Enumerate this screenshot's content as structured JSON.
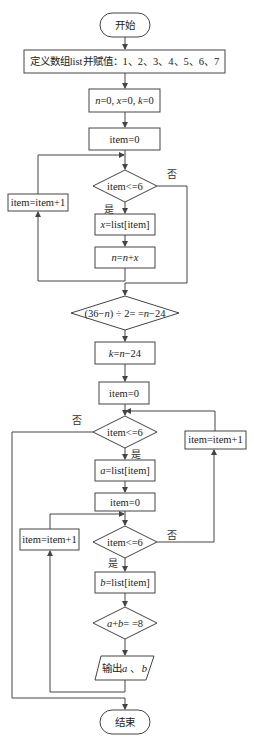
{
  "diagram": {
    "type": "flowchart",
    "colors": {
      "stroke": "#444444",
      "text": "#222222",
      "background": "#ffffff"
    },
    "nodes": {
      "start": {
        "shape": "terminal",
        "label": "开始"
      },
      "define_list": {
        "shape": "process",
        "label": "定义数组list并赋值：1、2、3、4、5、6、7"
      },
      "init_vars": {
        "shape": "process",
        "label": "n=0, x=0, k=0"
      },
      "item_init_1": {
        "shape": "process",
        "label": "item=0"
      },
      "cond_1": {
        "shape": "decision",
        "label": "item<=6"
      },
      "incr_1": {
        "shape": "process",
        "label": "item=item+1"
      },
      "assign_x": {
        "shape": "process",
        "label": "x=list[item]"
      },
      "sum_n": {
        "shape": "process",
        "label": "n=n+x"
      },
      "cond_check": {
        "shape": "decision",
        "label": "(36−n) ÷ 2= =n−24"
      },
      "assign_k": {
        "shape": "process",
        "label": "k=n−24"
      },
      "item_init_2": {
        "shape": "process",
        "label": "item=0"
      },
      "cond_2": {
        "shape": "decision",
        "label": "item<=6"
      },
      "incr_2": {
        "shape": "process",
        "label": "item=item+1"
      },
      "assign_a": {
        "shape": "process",
        "label": "a=list[item]"
      },
      "item_init_3": {
        "shape": "process",
        "label": "item=0"
      },
      "cond_3": {
        "shape": "decision",
        "label": "item<=6"
      },
      "incr_3": {
        "shape": "process",
        "label": "item=item+1"
      },
      "assign_b": {
        "shape": "process",
        "label": "b=list[item]"
      },
      "cond_sum": {
        "shape": "decision",
        "label": "a+b= =8"
      },
      "output": {
        "shape": "io",
        "label": "输出a、b"
      },
      "end": {
        "shape": "terminal",
        "label": "结束"
      }
    },
    "edge_labels": {
      "cond_1_yes": "是",
      "cond_1_no": "否",
      "cond_2_yes": "是",
      "cond_2_no": "否",
      "cond_3_yes": "是",
      "cond_3_no": "否"
    },
    "text_parts": {
      "init_vars": {
        "n": "n",
        "eq0a": "=0, ",
        "x": "x",
        "eq0b": "=0, ",
        "k": "k",
        "eq0c": "=0"
      },
      "assign_x": {
        "var": "x",
        "rest": "=list[item]"
      },
      "sum_n": {
        "n1": "n",
        "eq": "=",
        "n2": "n",
        "plus": "+",
        "x": "x"
      },
      "cond_check": {
        "p1": "(36−",
        "n1": "n",
        "p2": ") ÷ 2= =",
        "n2": "n",
        "p3": "−24"
      },
      "assign_k": {
        "k": "k",
        "eq": "=",
        "n": "n",
        "rest": "−24"
      },
      "assign_a": {
        "var": "a",
        "rest": "=list[item]"
      },
      "assign_b": {
        "var": "b",
        "rest": "=list[item]"
      },
      "cond_sum": {
        "a": "a",
        "plus": "+",
        "b": "b",
        "rest": "= =8"
      },
      "output": {
        "prefix": "输出",
        "a": "a",
        "sep": " 、",
        "b": "b"
      }
    }
  }
}
